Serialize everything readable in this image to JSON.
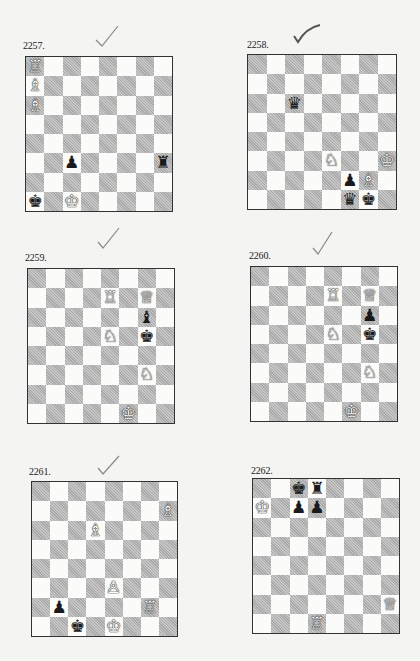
{
  "page": {
    "background": "#f4f4f2"
  },
  "glyphs": {
    "wK": "♔",
    "wQ": "♕",
    "wR": "♖",
    "wB": "♗",
    "wN": "♘",
    "wP": "♙",
    "bK": "♚",
    "bQ": "♛",
    "bR": "♜",
    "bB": "♝",
    "bN": "♞",
    "bP": "♟"
  },
  "puzzles": [
    {
      "number": "2257.",
      "checked": true,
      "check_style": "light",
      "pieces": [
        {
          "sq": "a8",
          "p": "wR"
        },
        {
          "sq": "a7",
          "p": "wB"
        },
        {
          "sq": "a6",
          "p": "wB"
        },
        {
          "sq": "c3",
          "p": "bP"
        },
        {
          "sq": "h3",
          "p": "bR"
        },
        {
          "sq": "a1",
          "p": "bK"
        },
        {
          "sq": "c1",
          "p": "wK"
        }
      ]
    },
    {
      "number": "2258.",
      "checked": true,
      "check_style": "bold",
      "pieces": [
        {
          "sq": "c6",
          "p": "bQ"
        },
        {
          "sq": "e3",
          "p": "wN"
        },
        {
          "sq": "h3",
          "p": "wK"
        },
        {
          "sq": "f2",
          "p": "bP"
        },
        {
          "sq": "g2",
          "p": "wB"
        },
        {
          "sq": "f1",
          "p": "bQ"
        },
        {
          "sq": "g1",
          "p": "bK"
        }
      ]
    },
    {
      "number": "2259.",
      "checked": true,
      "check_style": "light",
      "pieces": [
        {
          "sq": "e7",
          "p": "wR"
        },
        {
          "sq": "g7",
          "p": "wQ"
        },
        {
          "sq": "g6",
          "p": "bB"
        },
        {
          "sq": "e5",
          "p": "wN"
        },
        {
          "sq": "g5",
          "p": "bK"
        },
        {
          "sq": "g3",
          "p": "wN"
        },
        {
          "sq": "f1",
          "p": "wK"
        }
      ]
    },
    {
      "number": "2260.",
      "checked": true,
      "check_style": "light",
      "pieces": [
        {
          "sq": "e7",
          "p": "wR"
        },
        {
          "sq": "g7",
          "p": "wQ"
        },
        {
          "sq": "g6",
          "p": "bP"
        },
        {
          "sq": "e5",
          "p": "wN"
        },
        {
          "sq": "g5",
          "p": "bK"
        },
        {
          "sq": "g3",
          "p": "wN"
        },
        {
          "sq": "f1",
          "p": "wK"
        }
      ]
    },
    {
      "number": "2261.",
      "checked": true,
      "check_style": "light",
      "pieces": [
        {
          "sq": "h7",
          "p": "wB"
        },
        {
          "sq": "d6",
          "p": "wB"
        },
        {
          "sq": "e3",
          "p": "wP"
        },
        {
          "sq": "b2",
          "p": "bP"
        },
        {
          "sq": "g2",
          "p": "wR"
        },
        {
          "sq": "c1",
          "p": "bK"
        },
        {
          "sq": "e1",
          "p": "wK"
        }
      ]
    },
    {
      "number": "2262.",
      "checked": false,
      "pieces": [
        {
          "sq": "c8",
          "p": "bK"
        },
        {
          "sq": "d8",
          "p": "bR"
        },
        {
          "sq": "a7",
          "p": "wK"
        },
        {
          "sq": "c7",
          "p": "bP"
        },
        {
          "sq": "d7",
          "p": "bP"
        },
        {
          "sq": "h2",
          "p": "wQ"
        },
        {
          "sq": "d1",
          "p": "wR"
        }
      ]
    }
  ]
}
